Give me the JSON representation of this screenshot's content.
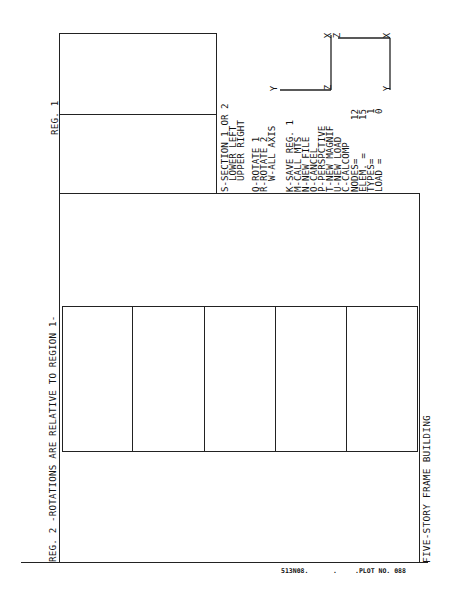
{
  "region1": {
    "label": "REG. 1"
  },
  "region2": {
    "label": "REG. 2 -ROTATIONS ARE RELATIVE TO REGION 1-"
  },
  "title": "FIVE-STORY FRAME BUILDING",
  "menu": {
    "items": [
      "S-SECTION 1 OR 2",
      "  LOWER LEFT",
      "  UPPER RIGHT",
      "Q-ROTATE 1",
      "R-ROTATE 2",
      "  W-ALL AXIS",
      "K-SAVE REG. 1",
      "M-CALL MTS",
      "N-NEW FILE",
      "O-CANCEL",
      "P-PERSPCTIVE",
      "T-NEW MAGNIF",
      "U-NEW LOAD",
      "C-CALCOMP"
    ],
    "stats": [
      {
        "label": "NODES=",
        "value": "12"
      },
      {
        "label": "ELEM. =",
        "value": "15"
      },
      {
        "label": "TYPES=",
        "value": "1"
      },
      {
        "label": "LOAD =",
        "value": "0"
      }
    ]
  },
  "axes": {
    "view1": {
      "x": "X",
      "y": "Y",
      "z": "Z"
    },
    "view2": {
      "x": "X",
      "y": "Y"
    }
  },
  "footer": {
    "job": "513N08.",
    "sep": ".",
    "plot": ".PLOT NO. 088"
  },
  "colors": {
    "ink": "#222222",
    "paper": "#ffffff"
  }
}
